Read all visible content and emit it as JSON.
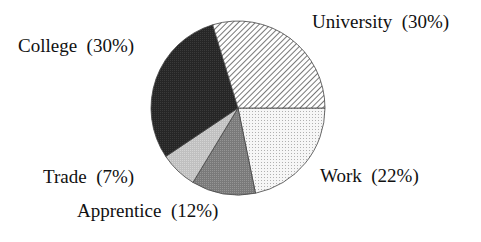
{
  "chart_data": {
    "type": "pie",
    "title": "",
    "categories": [
      "University",
      "Work",
      "Apprentice",
      "Trade",
      "College"
    ],
    "values": [
      30,
      22,
      12,
      7,
      30
    ],
    "units": "%",
    "start_angle_deg": 0,
    "direction": "clockwise from east for Work; University occupies upper-right",
    "legend": "none (direct labels)",
    "slices": [
      {
        "name": "University",
        "value": 30,
        "label": "University  (30%)",
        "fill": "diagonal-hatch",
        "color": "#bbbbbb"
      },
      {
        "name": "Work",
        "value": 22,
        "label": "Work  (22%)",
        "fill": "light-dots",
        "color": "#eeeeee"
      },
      {
        "name": "Apprentice",
        "value": 12,
        "label": "Apprentice  (12%)",
        "fill": "medium-gray",
        "color": "#808080"
      },
      {
        "name": "Trade",
        "value": 7,
        "label": "Trade  (7%)",
        "fill": "light-gray",
        "color": "#c4c4c4"
      },
      {
        "name": "College",
        "value": 30,
        "label": "College  (30%)",
        "fill": "dark",
        "color": "#2a2a2a"
      }
    ]
  },
  "labels": {
    "university": "University  (30%)",
    "work": "Work  (22%)",
    "apprentice": "Apprentice  (12%)",
    "trade": "Trade  (7%)",
    "college": "College  (30%)"
  }
}
